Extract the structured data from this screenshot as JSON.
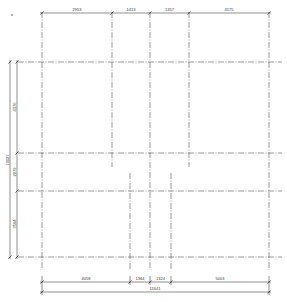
{
  "drawing": {
    "type": "architectural-axis-grid",
    "top_dimensions": [
      "2953",
      "1413",
      "1357",
      "4175"
    ],
    "left_dimensions": [
      "4370",
      "2079",
      "3564"
    ],
    "left_total": "10027",
    "bottom_dimensions": [
      "4058",
      "1364",
      "1324",
      "5003"
    ],
    "bottom_total": "11641"
  },
  "geometry": {
    "top_axes_x": [
      42,
      112,
      150,
      189,
      269
    ],
    "bottom_axes_x": [
      42,
      130,
      150,
      171,
      269
    ],
    "axes_y": [
      62,
      153,
      191,
      257
    ],
    "colors": {
      "line": "#555555",
      "text": "#333333",
      "background": "#ffffff"
    }
  }
}
